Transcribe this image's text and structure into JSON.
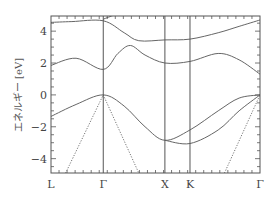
{
  "chart_data": {
    "type": "line",
    "title": "",
    "xlabel": "",
    "ylabel": "エネルギー [eV]",
    "ylim": [
      -4.9,
      4.95
    ],
    "grid": false,
    "legend": null,
    "x_ticks": [
      {
        "label": "L",
        "pos": 0.0
      },
      {
        "label": "Γ",
        "pos": 0.25
      },
      {
        "label": "X",
        "pos": 0.545
      },
      {
        "label": "K",
        "pos": 0.665
      },
      {
        "label": "Γ",
        "pos": 1.0
      }
    ],
    "y_ticks": [
      4,
      2,
      0,
      -2,
      -4
    ],
    "series": [
      {
        "name": "band-top-1",
        "style": "solid",
        "points": [
          [
            0.0,
            4.55
          ],
          [
            0.1,
            4.6
          ],
          [
            0.25,
            4.65
          ],
          [
            0.35,
            3.9
          ],
          [
            0.42,
            3.4
          ],
          [
            0.545,
            3.45
          ],
          [
            0.665,
            3.5
          ],
          [
            0.8,
            3.9
          ],
          [
            0.9,
            4.3
          ],
          [
            1.0,
            4.7
          ]
        ]
      },
      {
        "name": "band-top-2",
        "style": "solid",
        "points": [
          [
            0.25,
            4.75
          ],
          [
            0.3,
            5.0
          ]
        ]
      },
      {
        "name": "band-conduction",
        "style": "solid",
        "points": [
          [
            0.0,
            1.85
          ],
          [
            0.12,
            2.3
          ],
          [
            0.25,
            1.6
          ],
          [
            0.32,
            2.6
          ],
          [
            0.38,
            3.1
          ],
          [
            0.45,
            2.5
          ],
          [
            0.545,
            2.0
          ],
          [
            0.665,
            2.1
          ],
          [
            0.8,
            2.6
          ],
          [
            0.9,
            2.2
          ],
          [
            1.0,
            1.3
          ]
        ]
      },
      {
        "name": "band-valence-1",
        "style": "solid",
        "points": [
          [
            0.0,
            -1.35
          ],
          [
            0.12,
            -0.6
          ],
          [
            0.25,
            0.0
          ],
          [
            0.35,
            -0.7
          ],
          [
            0.45,
            -2.0
          ],
          [
            0.545,
            -2.85
          ],
          [
            0.665,
            -2.2
          ],
          [
            0.8,
            -1.0
          ],
          [
            0.9,
            -0.2
          ],
          [
            1.0,
            0.0
          ]
        ]
      },
      {
        "name": "band-valence-2",
        "style": "solid",
        "points": [
          [
            0.545,
            -2.85
          ],
          [
            0.665,
            -3.05
          ],
          [
            0.8,
            -2.2
          ],
          [
            0.9,
            -1.0
          ],
          [
            1.0,
            0.0
          ]
        ]
      },
      {
        "name": "band-dotted-L-Gamma",
        "style": "dotted",
        "points": [
          [
            0.07,
            -4.9
          ],
          [
            0.25,
            0.0
          ]
        ]
      },
      {
        "name": "band-dotted-Gamma-X",
        "style": "dotted",
        "points": [
          [
            0.25,
            0.0
          ],
          [
            0.42,
            -4.9
          ]
        ]
      },
      {
        "name": "band-dotted-K-Gamma",
        "style": "dotted",
        "points": [
          [
            0.83,
            -4.9
          ],
          [
            1.0,
            0.0
          ]
        ]
      }
    ]
  }
}
